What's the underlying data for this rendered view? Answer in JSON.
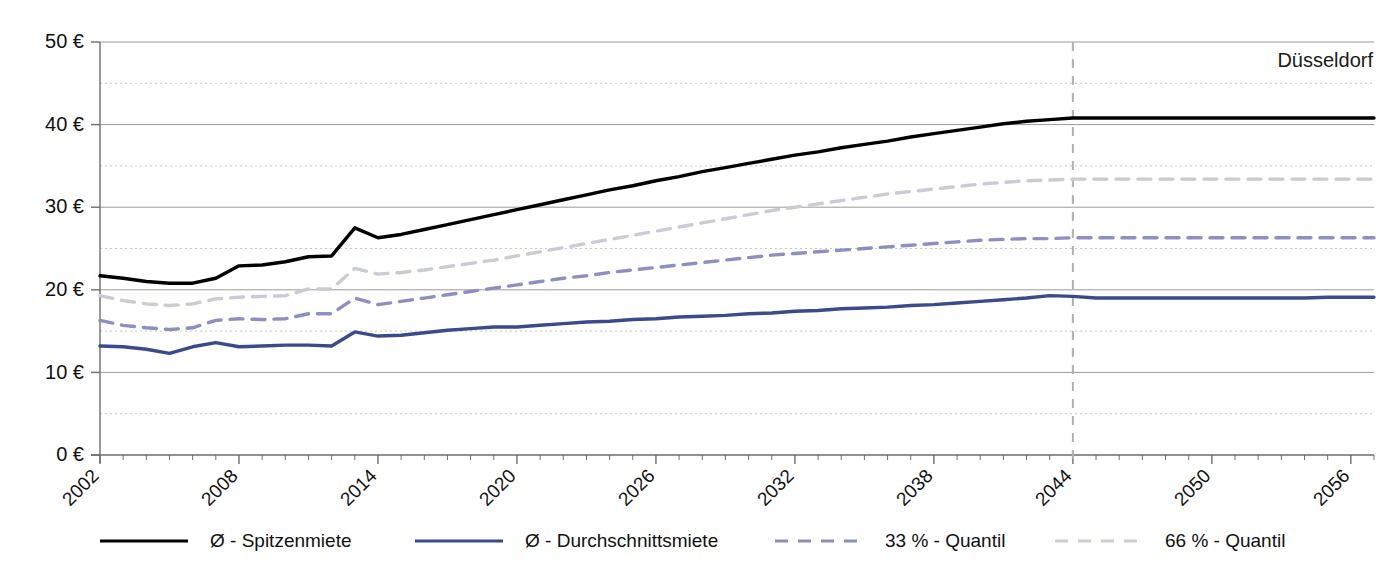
{
  "corner_label": "Düsseldorf",
  "colors": {
    "spitzenmiete": "#000000",
    "durchschnittsmiete": "#3b4a8c",
    "quantil33": "#8b8fc2",
    "quantil66": "#c9ccd6",
    "grid_major": "#9a9a9a",
    "grid_minor": "#c8c8c8",
    "axis": "#6e6e6e",
    "forecast_divider": "#b0b0b0"
  },
  "legend": {
    "items": [
      {
        "label": "Ø - Spitzenmiete",
        "style": "solid",
        "color": "#000000",
        "width": 3.2,
        "x": 100
      },
      {
        "label": "Ø - Durchschnittsmiete",
        "style": "solid",
        "color": "#3b4a8c",
        "width": 3.2,
        "x": 415
      },
      {
        "label": "33 % - Quantil",
        "style": "dashed",
        "color": "#8b8fc2",
        "width": 3.2,
        "x": 775
      },
      {
        "label": "66 % - Quantil",
        "style": "dashed",
        "color": "#c9ccd6",
        "width": 3.2,
        "x": 1055
      }
    ],
    "y": 541
  },
  "chart_data": {
    "type": "line",
    "title": "",
    "subtitle": "",
    "xlabel": "",
    "ylabel": "",
    "xlim": [
      2002,
      2057
    ],
    "ylim": [
      0,
      50
    ],
    "grid": {
      "major_step": 10,
      "minor_step": 5,
      "major_values": [
        0,
        10,
        20,
        30,
        40,
        50
      ],
      "minor_values": [
        5,
        15,
        25,
        35,
        45
      ]
    },
    "y_tick_labels": [
      "0 €",
      "10 €",
      "20 €",
      "30 €",
      "40 €",
      "50 €"
    ],
    "y_tick_values": [
      0,
      10,
      20,
      30,
      40,
      50
    ],
    "x_tick_labels": [
      "2002",
      "2008",
      "2014",
      "2020",
      "2026",
      "2032",
      "2038",
      "2044",
      "2050",
      "2056"
    ],
    "x_tick_values": [
      2002,
      2008,
      2014,
      2020,
      2026,
      2032,
      2038,
      2044,
      2050,
      2056
    ],
    "x_minor_ticks_every": 1,
    "forecast_start": 2044,
    "legend_position": "bottom",
    "x": [
      2002,
      2003,
      2004,
      2005,
      2006,
      2007,
      2008,
      2009,
      2010,
      2011,
      2012,
      2013,
      2014,
      2015,
      2016,
      2017,
      2018,
      2019,
      2020,
      2021,
      2022,
      2023,
      2024,
      2025,
      2026,
      2027,
      2028,
      2029,
      2030,
      2031,
      2032,
      2033,
      2034,
      2035,
      2036,
      2037,
      2038,
      2039,
      2040,
      2041,
      2042,
      2043,
      2044,
      2045,
      2046,
      2047,
      2048,
      2049,
      2050,
      2051,
      2052,
      2053,
      2054,
      2055,
      2056,
      2057
    ],
    "series": [
      {
        "name": "Ø - Spitzenmiete",
        "color": "#000000",
        "style": "solid",
        "values": [
          21.7,
          21.4,
          21.0,
          20.8,
          20.8,
          21.4,
          22.9,
          23.0,
          23.4,
          24.0,
          24.1,
          27.5,
          26.3,
          26.7,
          27.3,
          27.9,
          28.5,
          29.1,
          29.7,
          30.3,
          30.9,
          31.5,
          32.1,
          32.6,
          33.2,
          33.7,
          34.3,
          34.8,
          35.3,
          35.8,
          36.3,
          36.7,
          37.2,
          37.6,
          38.0,
          38.5,
          38.9,
          39.3,
          39.7,
          40.1,
          40.4,
          40.6,
          40.8,
          40.8,
          40.8,
          40.8,
          40.8,
          40.8,
          40.8,
          40.8,
          40.8,
          40.8,
          40.8,
          40.8,
          40.8,
          40.8
        ]
      },
      {
        "name": "66 % - Quantil",
        "color": "#c9ccd6",
        "style": "dashed",
        "values": [
          19.3,
          18.7,
          18.3,
          18.1,
          18.3,
          18.9,
          19.1,
          19.2,
          19.3,
          20.1,
          20.1,
          22.6,
          21.9,
          22.1,
          22.4,
          22.8,
          23.2,
          23.6,
          24.1,
          24.6,
          25.1,
          25.6,
          26.1,
          26.6,
          27.1,
          27.6,
          28.1,
          28.6,
          29.1,
          29.6,
          30.0,
          30.4,
          30.8,
          31.2,
          31.6,
          31.9,
          32.2,
          32.5,
          32.8,
          33.0,
          33.2,
          33.3,
          33.4,
          33.4,
          33.4,
          33.4,
          33.4,
          33.4,
          33.4,
          33.4,
          33.4,
          33.4,
          33.4,
          33.4,
          33.4,
          33.4
        ]
      },
      {
        "name": "33 % - Quantil",
        "color": "#8b8fc2",
        "style": "dashed",
        "values": [
          16.3,
          15.7,
          15.4,
          15.2,
          15.4,
          16.3,
          16.5,
          16.4,
          16.5,
          17.1,
          17.1,
          19.0,
          18.2,
          18.6,
          19.0,
          19.4,
          19.8,
          20.2,
          20.6,
          21.0,
          21.4,
          21.7,
          22.1,
          22.4,
          22.7,
          23.0,
          23.3,
          23.6,
          23.9,
          24.2,
          24.4,
          24.6,
          24.8,
          25.0,
          25.2,
          25.4,
          25.6,
          25.8,
          26.0,
          26.1,
          26.2,
          26.2,
          26.3,
          26.3,
          26.3,
          26.3,
          26.3,
          26.3,
          26.3,
          26.3,
          26.3,
          26.3,
          26.3,
          26.3,
          26.3,
          26.3
        ]
      },
      {
        "name": "Ø - Durchschnittsmiete",
        "color": "#3b4a8c",
        "style": "solid",
        "values": [
          13.2,
          13.1,
          12.8,
          12.3,
          13.1,
          13.6,
          13.1,
          13.2,
          13.3,
          13.3,
          13.2,
          14.9,
          14.4,
          14.5,
          14.8,
          15.1,
          15.3,
          15.5,
          15.5,
          15.7,
          15.9,
          16.1,
          16.2,
          16.4,
          16.5,
          16.7,
          16.8,
          16.9,
          17.1,
          17.2,
          17.4,
          17.5,
          17.7,
          17.8,
          17.9,
          18.1,
          18.2,
          18.4,
          18.6,
          18.8,
          19.0,
          19.3,
          19.2,
          19.0,
          19.0,
          19.0,
          19.0,
          19.0,
          19.0,
          19.0,
          19.0,
          19.0,
          19.0,
          19.1,
          19.1,
          19.1
        ]
      }
    ]
  }
}
